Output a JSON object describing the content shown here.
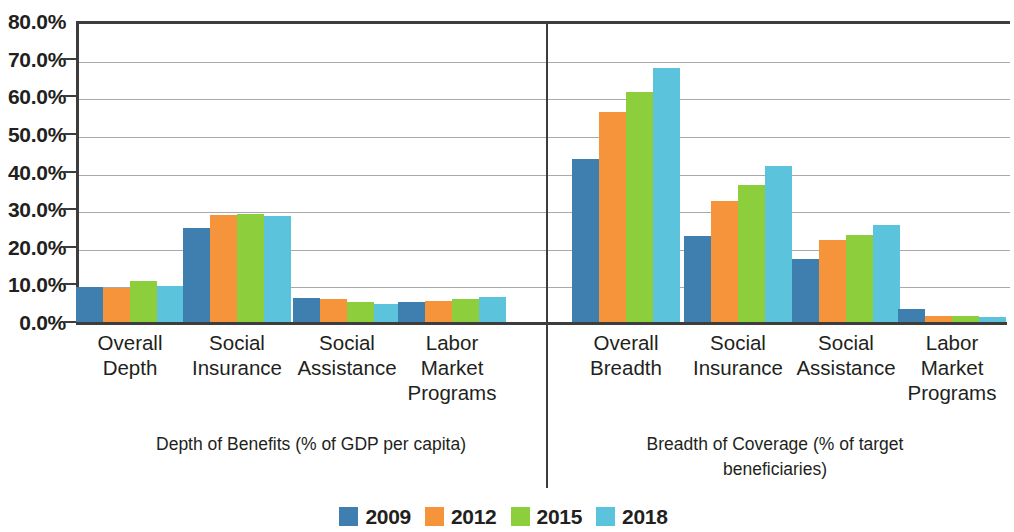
{
  "chart_data": {
    "type": "bar",
    "title": "",
    "subtitle": "",
    "xlabel": "",
    "ylabel": "",
    "ylim": [
      0,
      80
    ],
    "y_tick_labels": [
      "0.0%",
      "10.0%",
      "20.0%",
      "30.0%",
      "40.0%",
      "50.0%",
      "60.0%",
      "70.0%",
      "80.0%"
    ],
    "y_tick_values": [
      0,
      10,
      20,
      30,
      40,
      50,
      60,
      70,
      80
    ],
    "grid": "horizontal",
    "legend_position": "bottom-center",
    "series": [
      {
        "name": "2009",
        "color": "#3E7FB0",
        "values": [
          9.2,
          25.0,
          6.4,
          5.4,
          43.2,
          22.8,
          16.8,
          3.4
        ]
      },
      {
        "name": "2012",
        "color": "#F5943A",
        "values": [
          9.1,
          28.4,
          6.1,
          5.6,
          55.8,
          32.2,
          21.9,
          1.6
        ]
      },
      {
        "name": "2015",
        "color": "#8DCE3C",
        "values": [
          10.8,
          28.7,
          5.2,
          6.2,
          61.1,
          36.3,
          23.0,
          1.5
        ]
      },
      {
        "name": "2018",
        "color": "#5BC4DC",
        "values": [
          9.5,
          28.3,
          4.8,
          6.6,
          67.4,
          41.4,
          25.7,
          1.4
        ]
      }
    ],
    "categories": [
      "Overall Depth",
      "Social Insurance",
      "Social Assistance",
      "Labor Market Programs",
      "Overall Breadth",
      "Social Insurance",
      "Social Assistance",
      "Labor Market Programs"
    ],
    "category_label_lines": [
      [
        "Overall",
        "Depth"
      ],
      [
        "Social",
        "Insurance"
      ],
      [
        "Social",
        "Assistance"
      ],
      [
        "Labor",
        "Market",
        "Programs"
      ],
      [
        "Overall",
        "Breadth"
      ],
      [
        "Social",
        "Insurance"
      ],
      [
        "Social",
        "Assistance"
      ],
      [
        "Labor",
        "Market",
        "Programs"
      ]
    ],
    "panels": [
      {
        "caption": "Depth of Benefits (% of GDP per capita)",
        "caption_lines": [
          "Depth of Benefits (% of GDP per capita)"
        ],
        "category_indices": [
          0,
          1,
          2,
          3
        ]
      },
      {
        "caption": "Breadth of Coverage (% of target beneficiaries)",
        "caption_lines": [
          "Breadth of Coverage (% of target",
          "beneficiaries)"
        ],
        "category_indices": [
          4,
          5,
          6,
          7
        ]
      }
    ]
  },
  "legend": {
    "items": [
      {
        "label": "2009",
        "color": "#3E7FB0"
      },
      {
        "label": "2012",
        "color": "#F5943A"
      },
      {
        "label": "2015",
        "color": "#8DCE3C"
      },
      {
        "label": "2018",
        "color": "#5BC4DC"
      }
    ]
  },
  "axes": {
    "axis_color": "#3d3d3d",
    "grid_color": "#a9a9a9"
  }
}
